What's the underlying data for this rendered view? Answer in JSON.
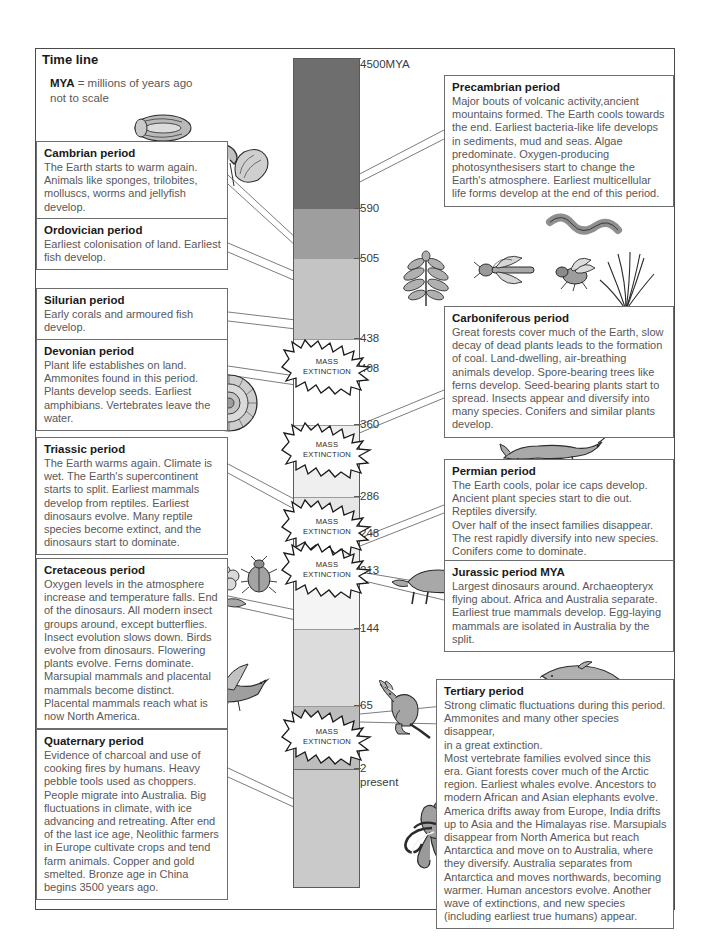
{
  "header": {
    "title": "Time line",
    "legend_key": "MYA",
    "legend_text": " = millions of years ago",
    "legend_note": "not to scale"
  },
  "colors": {
    "precambrian_band": "#6e6e6e",
    "cambrian_band": "#9e9e9e",
    "ordovician_band": "#c4c4c4",
    "silurian_band": "#ffffff",
    "devonian_band": "#f0f0f0",
    "carboniferous_band": "#e2e2e2",
    "permian_band": "#d6d6d6",
    "triassic_band": "#ededed",
    "jurassic_band": "#e6e6e6",
    "cretaceous_band": "#cfcfcf",
    "tertiary_band": "#b8b8b8",
    "quaternary_band": "#c9c9c9",
    "box_border": "#6d6d6d",
    "text_body": "#58585a",
    "text_title": "#1a1a1a"
  },
  "timeline": {
    "axis_ticks": [
      {
        "label": "4500MYA",
        "y": 58
      },
      {
        "label": "590",
        "y": 208
      },
      {
        "label": "505",
        "y": 258
      },
      {
        "label": "438",
        "y": 338
      },
      {
        "label": "408",
        "y": 368
      },
      {
        "label": "360",
        "y": 424
      },
      {
        "label": "286",
        "y": 496
      },
      {
        "label": "248",
        "y": 533
      },
      {
        "label": "213",
        "y": 570
      },
      {
        "label": "144",
        "y": 628
      },
      {
        "label": "65",
        "y": 705
      },
      {
        "label": "2",
        "y": 768
      },
      {
        "label": "present",
        "y": 780
      }
    ],
    "bands": [
      {
        "name": "precambrian",
        "top": 0,
        "height": 150,
        "color": "#6e6e6e"
      },
      {
        "name": "cambrian",
        "top": 150,
        "height": 50,
        "color": "#9e9e9e"
      },
      {
        "name": "ordovician",
        "top": 200,
        "height": 80,
        "color": "#c4c4c4"
      },
      {
        "name": "silurian",
        "top": 280,
        "height": 30,
        "color": "#fafafa"
      },
      {
        "name": "devonian",
        "top": 310,
        "height": 56,
        "color": "#ffffff"
      },
      {
        "name": "carboniferous",
        "top": 366,
        "height": 72,
        "color": "#efefef"
      },
      {
        "name": "permian",
        "top": 438,
        "height": 37,
        "color": "#e7e7e7"
      },
      {
        "name": "triassic",
        "top": 475,
        "height": 37,
        "color": "#efefef"
      },
      {
        "name": "jurassic",
        "top": 512,
        "height": 58,
        "color": "#f4f4f4"
      },
      {
        "name": "cretaceous",
        "top": 570,
        "height": 77,
        "color": "#dcdcdc"
      },
      {
        "name": "tertiary",
        "top": 647,
        "height": 63,
        "color": "#bdbdbd"
      },
      {
        "name": "quaternary",
        "top": 710,
        "height": 118,
        "color": "#cacaca"
      }
    ],
    "mass_extinctions": [
      {
        "label_line1": "MASS",
        "label_line2": "EXTINCTION",
        "y": 345
      },
      {
        "label_line1": "MASS",
        "label_line2": "EXTINCTION",
        "y": 428
      },
      {
        "label_line1": "MASS",
        "label_line2": "EXTINCTION",
        "y": 505
      },
      {
        "label_line1": "MASS",
        "label_line2": "EXTINCTION",
        "y": 548
      },
      {
        "label_line1": "MASS",
        "label_line2": "EXTINCTION",
        "y": 715
      }
    ]
  },
  "periods_left": [
    {
      "id": "cambrian",
      "title": "Cambrian period",
      "body": "The Earth starts to warm again. Animals like sponges, trilobites, molluscs, worms and jellyfish develop."
    },
    {
      "id": "ordovician",
      "title": "Ordovician period",
      "body": "Earliest colonisation of land. Earliest fish develop."
    },
    {
      "id": "silurian",
      "title": "Silurian period",
      "body": "Early corals and armoured fish develop."
    },
    {
      "id": "devonian",
      "title": "Devonian period",
      "body": "Plant life establishes on land. Ammonites found in this period. Plants develop seeds. Earliest amphibians. Vertebrates leave the water."
    },
    {
      "id": "triassic",
      "title": "Triassic period",
      "body": "The Earth warms again. Climate is wet. The Earth's supercontinent starts to split. Earliest mammals develop from reptiles. Earliest dinosaurs evolve. Many reptile species become extinct, and the dinosaurs start to dominate."
    },
    {
      "id": "cretaceous",
      "title": "Cretaceous period",
      "body": "Oxygen levels in the atmosphere increase and temperature falls. End of the dinosaurs. All modern insect groups around, except butterflies. Insect evolution slows down. Birds evolve from dinosaurs. Flowering plants evolve. Ferns dominate. Marsupial mammals and placental mammals become distinct. Placental mammals reach what is now North America."
    },
    {
      "id": "quaternary",
      "title": "Quaternary period",
      "body": "Evidence of charcoal and use of cooking fires by humans. Heavy pebble tools used as choppers. People migrate into Australia. Big fluctuations in climate, with ice advancing and retreating. After end of the last ice age, Neolithic farmers in Europe cultivate crops and tend farm animals. Copper and gold smelted. Bronze age in China begins 3500 years ago."
    }
  ],
  "periods_right": [
    {
      "id": "precambrian",
      "title": "Precambrian period",
      "body": "Major bouts of volcanic activity,ancient mountains formed. The Earth cools towards the end. Earliest bacteria-like life develops in sediments, mud and seas. Algae predominate. Oxygen-producing photosynthesisers start to change the Earth's atmosphere. Earliest multicellular life forms develop at the end of this period."
    },
    {
      "id": "carboniferous",
      "title": "Carboniferous period",
      "body": "Great forests cover much of the Earth, slow decay of dead plants leads to the formation of coal. Land-dwelling, air-breathing animals develop. Spore-bearing trees like ferns develop. Seed-bearing plants start to spread. Insects appear and diversify into many species. Conifers and similar plants develop."
    },
    {
      "id": "permian",
      "title": "Permian period",
      "body": "The Earth cools, polar ice caps develop.\nAncient plant species start to die out. Reptiles diversify.\nOver half of the insect families disappear. The rest rapidly diversify into new species.\nConifers come to dominate."
    },
    {
      "id": "jurassic",
      "title": "Jurassic period MYA",
      "body": "Largest dinosaurs around. Archaeopteryx flying about. Africa and Australia separate. Earliest true mammals develop. Egg-laying mammals are isolated in Australia by the split."
    },
    {
      "id": "tertiary",
      "title": "Tertiary period",
      "body": "Strong climatic fluctuations during this period.\nAmmonites and many other species disappear,\nin a great extinction.\nMost vertebrate families evolved since this era. Giant forests cover much of the Arctic region. Earliest whales evolve. Ancestors to modern African and Asian elephants evolve. America drifts away from Europe, India drifts up to Asia and the Himalayas rise. Marsupials disappear from North America but reach Antarctica and move on to Australia, where they diversify. Australia separates from Antarctica and moves northwards, becoming warmer. Human ancestors evolve. Another wave of extinctions, and new species (including earliest true humans) appear."
    }
  ],
  "illustrations": [
    {
      "name": "trilobite-illustration"
    },
    {
      "name": "jellyfish-illustration"
    },
    {
      "name": "mollusc-shell-illustration"
    },
    {
      "name": "bacteria-filament-illustration"
    },
    {
      "name": "fern-illustration"
    },
    {
      "name": "dragonfly-illustration"
    },
    {
      "name": "fly-illustration"
    },
    {
      "name": "conifer-branch-illustration"
    },
    {
      "name": "ammonite-illustration"
    },
    {
      "name": "reptile-illustration"
    },
    {
      "name": "flower-illustration"
    },
    {
      "name": "beetle-illustration"
    },
    {
      "name": "bird-illustration"
    },
    {
      "name": "triceratops-illustration"
    },
    {
      "name": "sauropod-illustration"
    },
    {
      "name": "kangaroo-illustration"
    },
    {
      "name": "dolphin-illustration"
    },
    {
      "name": "mammoth-illustration"
    }
  ]
}
